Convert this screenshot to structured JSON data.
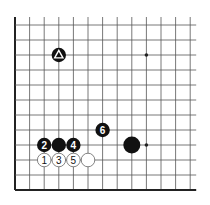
{
  "diagram": {
    "type": "go-board-diagram",
    "grid": {
      "columns": 13,
      "rows": 12,
      "origin_x": 15,
      "origin_y": 25,
      "spacing_x": 14.6,
      "spacing_y": 15,
      "line_extend_top": 8,
      "line_extend_right": 6,
      "left_edge": true,
      "bottom_edge": true,
      "line_color": "#555555",
      "edge_color": "#222222"
    },
    "star_points": [
      {
        "col": 9,
        "row": 2
      },
      {
        "col": 9,
        "row": 8
      }
    ],
    "stones": [
      {
        "color": "black",
        "col": 3,
        "row": 2,
        "marker": "triangle",
        "label": ""
      },
      {
        "color": "black",
        "col": 6,
        "row": 7,
        "marker": "",
        "label": "6"
      },
      {
        "color": "black",
        "col": 8,
        "row": 8,
        "marker": "",
        "label": "",
        "size": "large"
      },
      {
        "color": "black",
        "col": 2,
        "row": 8,
        "marker": "",
        "label": "2"
      },
      {
        "color": "black",
        "col": 3,
        "row": 8,
        "marker": "",
        "label": ""
      },
      {
        "color": "black",
        "col": 4,
        "row": 8,
        "marker": "",
        "label": "4"
      },
      {
        "color": "white",
        "col": 2,
        "row": 9,
        "marker": "",
        "label": "1"
      },
      {
        "color": "white",
        "col": 3,
        "row": 9,
        "marker": "",
        "label": "3"
      },
      {
        "color": "white",
        "col": 4,
        "row": 9,
        "marker": "",
        "label": "5"
      },
      {
        "color": "white",
        "col": 5,
        "row": 9,
        "marker": "",
        "label": ""
      }
    ],
    "colors": {
      "black_stone": "#111111",
      "white_stone": "#ffffff",
      "white_outline": "#666666",
      "star_point": "#222222"
    }
  }
}
